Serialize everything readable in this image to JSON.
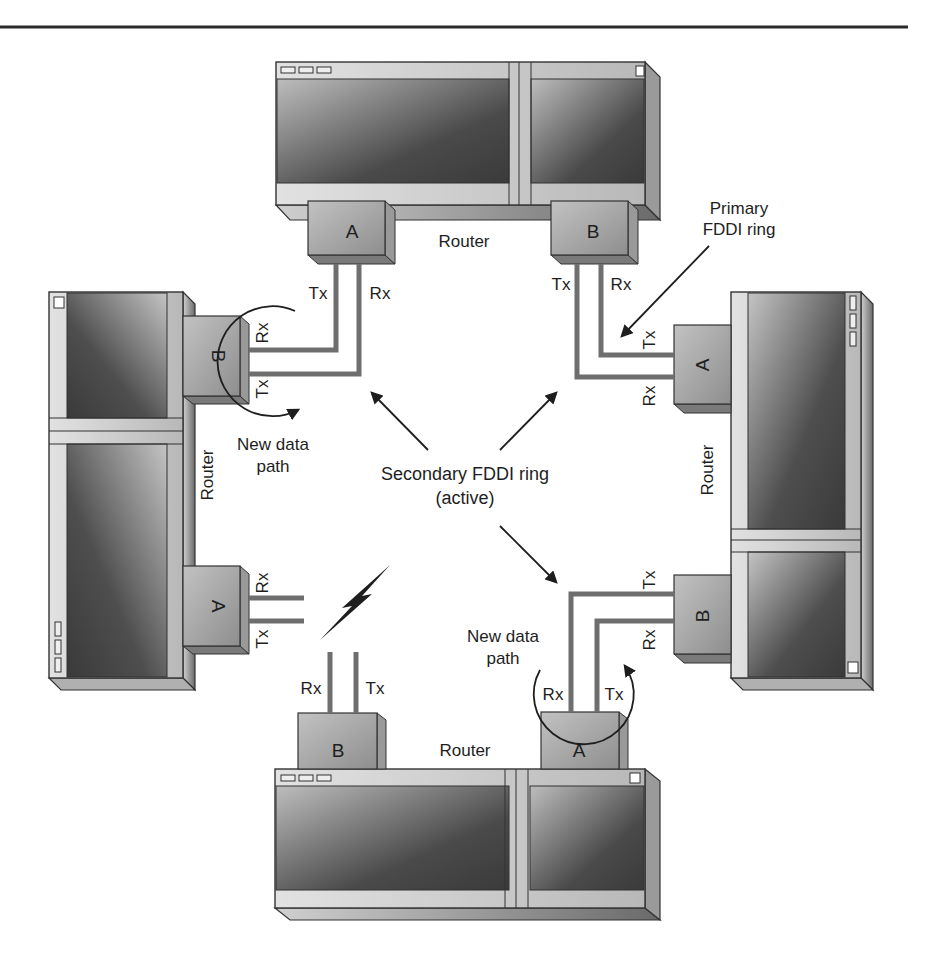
{
  "diagram": {
    "type": "network-topology",
    "colors": {
      "device_outline": "#333333",
      "fiber": "#6e6e6e",
      "module_fill": "#a8a8a8",
      "screen_dark": "#444444",
      "screen_light": "#bdbdbd",
      "frame_light": "#d8d8d8",
      "text": "#1e1e1e"
    },
    "routers": {
      "top": {
        "label": "Router",
        "ports": [
          {
            "name": "A",
            "signals": [
              "Tx",
              "Rx"
            ]
          },
          {
            "name": "B",
            "signals": [
              "Tx",
              "Rx"
            ]
          }
        ]
      },
      "right": {
        "label": "Router",
        "ports": [
          {
            "name": "A",
            "signals": [
              "Tx",
              "Rx"
            ]
          },
          {
            "name": "B",
            "signals": [
              "Tx",
              "Rx"
            ]
          }
        ]
      },
      "bottom": {
        "label": "Router",
        "ports": [
          {
            "name": "B",
            "signals": [
              "Rx",
              "Tx"
            ]
          },
          {
            "name": "A",
            "signals": [
              "Rx",
              "Tx"
            ]
          }
        ]
      },
      "left": {
        "label": "Router",
        "ports": [
          {
            "name": "B",
            "signals": [
              "Rx",
              "Tx"
            ]
          },
          {
            "name": "A",
            "signals": [
              "Rx",
              "Tx"
            ]
          }
        ]
      }
    },
    "signals": {
      "tx": "Tx",
      "rx": "Rx"
    },
    "annotations": {
      "primary_ring_line1": "Primary",
      "primary_ring_line2": "FDDI ring",
      "secondary_ring_line1": "Secondary FDDI ring",
      "secondary_ring_line2": "(active)",
      "new_path_line1": "New data",
      "new_path_line2": "path"
    },
    "failure_icon": "lightning-bolt-icon"
  }
}
